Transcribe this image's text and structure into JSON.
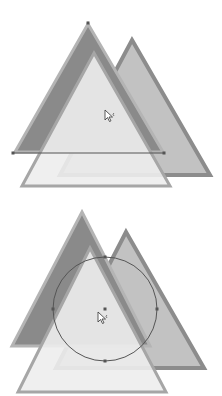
{
  "page": {
    "cut_off_text": "",
    "colors": {
      "background": "#ffffff",
      "dark_triangle_fill": "#8a8a8a",
      "dark_triangle_stroke": "#b4b4b4",
      "mid_triangle_fill": "#c2c2c2",
      "mid_triangle_stroke": "#8c8c8c",
      "light_triangle_fill": "#ededed",
      "light_triangle_stroke": "#a6a6a6",
      "selection_stroke": "#555555",
      "handle_fill": "#555555"
    }
  },
  "figures": [
    {
      "name": "figure-line-selection",
      "selection_type": "line",
      "cursor": "arrow-cursor-with-mark"
    },
    {
      "name": "figure-circle-selection",
      "selection_type": "circle",
      "cursor": "arrow-cursor-with-mark"
    }
  ]
}
